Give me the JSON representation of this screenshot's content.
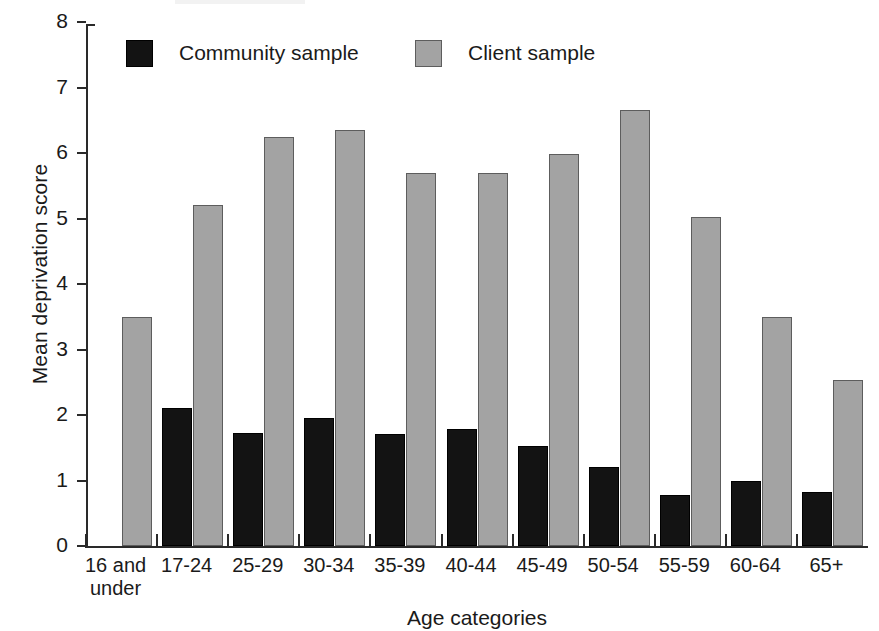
{
  "chart_data": {
    "type": "bar",
    "title": "",
    "xlabel": "Age categories",
    "ylabel": "Mean deprivation score",
    "ylim": [
      0,
      8
    ],
    "ytick_labels": [
      "0",
      "1",
      "2",
      "3",
      "4",
      "5",
      "6",
      "7",
      "8"
    ],
    "yticks": [
      0,
      1,
      2,
      3,
      4,
      5,
      6,
      7,
      8
    ],
    "grid": false,
    "legend_position": "top-inside",
    "categories": [
      "16 and under",
      "17-24",
      "25-29",
      "30-34",
      "35-39",
      "40-44",
      "45-49",
      "50-54",
      "55-59",
      "60-64",
      "65+"
    ],
    "series": [
      {
        "name": "Community sample",
        "color": "#131313",
        "values": [
          0,
          2.1,
          1.72,
          1.95,
          1.71,
          1.79,
          1.52,
          1.2,
          0.78,
          1.0,
          0.83
        ]
      },
      {
        "name": "Client sample",
        "color": "#a3a3a3",
        "values": [
          3.5,
          5.2,
          6.25,
          6.35,
          5.7,
          5.7,
          5.98,
          6.66,
          5.02,
          3.5,
          2.54
        ]
      }
    ]
  },
  "legend": {
    "entries": [
      {
        "label": "Community sample",
        "key": "community"
      },
      {
        "label": "Client sample",
        "key": "client"
      }
    ]
  },
  "axes": {
    "y_title": "Mean deprivation score",
    "x_title": "Age categories"
  }
}
